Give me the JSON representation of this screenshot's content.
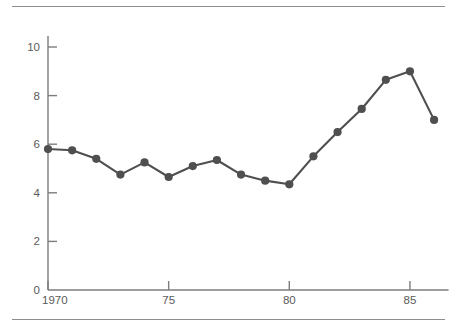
{
  "chart_data": {
    "type": "line",
    "title": "",
    "subtitle": "",
    "xlabel": "",
    "ylabel": "",
    "xlim": [
      1970,
      1986.6
    ],
    "ylim": [
      0,
      10.6
    ],
    "grid": false,
    "legend": null,
    "x_tick_labels": [
      "1970",
      "75",
      "80",
      "85"
    ],
    "x_tick_values": [
      1970,
      1975,
      1980,
      1985
    ],
    "y_tick_labels": [
      "0",
      "2",
      "4",
      "6",
      "8",
      "10"
    ],
    "y_tick_values": [
      0,
      2,
      4,
      6,
      8,
      10
    ],
    "x": [
      1970,
      1971,
      1972,
      1973,
      1974,
      1975,
      1976,
      1977,
      1978,
      1979,
      1980,
      1981,
      1982,
      1983,
      1984,
      1985,
      1986
    ],
    "values": [
      5.8,
      5.75,
      5.4,
      4.75,
      5.25,
      4.65,
      5.1,
      5.35,
      4.75,
      4.5,
      4.35,
      5.5,
      6.5,
      7.45,
      8.65,
      9.0,
      7.0
    ],
    "series": [
      {
        "name": "series-1",
        "values": [
          5.8,
          5.75,
          5.4,
          4.75,
          5.25,
          4.65,
          5.1,
          5.35,
          4.75,
          4.5,
          4.35,
          5.5,
          6.5,
          7.45,
          8.65,
          9.0,
          7.0
        ]
      }
    ],
    "marker": "circle",
    "line_color": "#4f4f4f",
    "marker_color": "#4f4f4f",
    "axis_color": "#7d7d7d",
    "rule_color": "#8e8e8e",
    "background": "#ffffff"
  },
  "figure": {
    "top_rule": "horizontal-rule",
    "bottom_rule": "horizontal-rule"
  }
}
